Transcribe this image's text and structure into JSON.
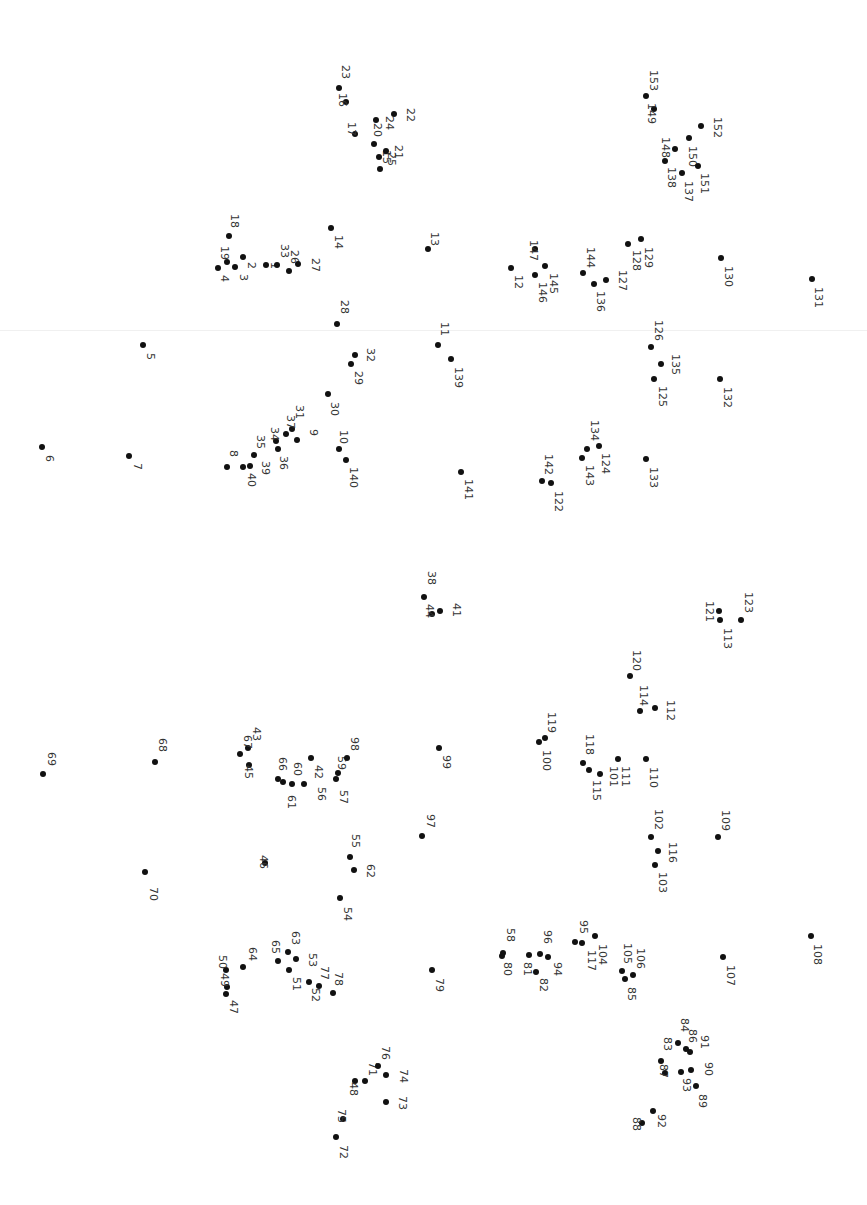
{
  "puzzle": {
    "type": "connect-the-dots",
    "orientation": "rotated-90deg",
    "dot_color": "#111111",
    "label_color": "#333333",
    "background": "#ffffff",
    "total_dots": 153,
    "dots": [
      {
        "n": "1",
        "x": 266,
        "y": 265,
        "lx": 274,
        "ly": 262
      },
      {
        "n": "2",
        "x": 243,
        "y": 257,
        "lx": 251,
        "ly": 262
      },
      {
        "n": "3",
        "x": 235,
        "y": 267,
        "lx": 243,
        "ly": 274
      },
      {
        "n": "4",
        "x": 218,
        "y": 268,
        "lx": 224,
        "ly": 275
      },
      {
        "n": "5",
        "x": 143,
        "y": 345,
        "lx": 150,
        "ly": 353
      },
      {
        "n": "6",
        "x": 42,
        "y": 447,
        "lx": 49,
        "ly": 455
      },
      {
        "n": "7",
        "x": 129,
        "y": 456,
        "lx": 137,
        "ly": 463
      },
      {
        "n": "8",
        "x": 227,
        "y": 467,
        "lx": 233,
        "ly": 450
      },
      {
        "n": "9",
        "x": 297,
        "y": 440,
        "lx": 313,
        "ly": 429
      },
      {
        "n": "10",
        "x": 339,
        "y": 449,
        "lx": 343,
        "ly": 430
      },
      {
        "n": "11",
        "x": 438,
        "y": 345,
        "lx": 444,
        "ly": 322
      },
      {
        "n": "12",
        "x": 511,
        "y": 268,
        "lx": 518,
        "ly": 275
      },
      {
        "n": "13",
        "x": 428,
        "y": 249,
        "lx": 434,
        "ly": 232
      },
      {
        "n": "14",
        "x": 331,
        "y": 228,
        "lx": 338,
        "ly": 235
      },
      {
        "n": "15",
        "x": 380,
        "y": 169,
        "lx": 386,
        "ly": 150
      },
      {
        "n": "16",
        "x": 346,
        "y": 102,
        "lx": 342,
        "ly": 93
      },
      {
        "n": "17",
        "x": 355,
        "y": 134,
        "lx": 351,
        "ly": 122
      },
      {
        "n": "18",
        "x": 229,
        "y": 236,
        "lx": 234,
        "ly": 214
      },
      {
        "n": "19",
        "x": 227,
        "y": 262,
        "lx": 224,
        "ly": 246
      },
      {
        "n": "20",
        "x": 374,
        "y": 144,
        "lx": 377,
        "ly": 123
      },
      {
        "n": "21",
        "x": 386,
        "y": 151,
        "lx": 398,
        "ly": 145
      },
      {
        "n": "22",
        "x": 394,
        "y": 114,
        "lx": 410,
        "ly": 108
      },
      {
        "n": "23",
        "x": 339,
        "y": 88,
        "lx": 345,
        "ly": 65
      },
      {
        "n": "24",
        "x": 376,
        "y": 120,
        "lx": 389,
        "ly": 116
      },
      {
        "n": "25",
        "x": 379,
        "y": 157,
        "lx": 391,
        "ly": 152
      },
      {
        "n": "26",
        "x": 289,
        "y": 271,
        "lx": 294,
        "ly": 250
      },
      {
        "n": "27",
        "x": 298,
        "y": 264,
        "lx": 315,
        "ly": 258
      },
      {
        "n": "28",
        "x": 337,
        "y": 324,
        "lx": 344,
        "ly": 300
      },
      {
        "n": "29",
        "x": 351,
        "y": 364,
        "lx": 358,
        "ly": 371
      },
      {
        "n": "30",
        "x": 328,
        "y": 394,
        "lx": 334,
        "ly": 402
      },
      {
        "n": "31",
        "x": 292,
        "y": 429,
        "lx": 299,
        "ly": 405
      },
      {
        "n": "32",
        "x": 355,
        "y": 355,
        "lx": 370,
        "ly": 348
      },
      {
        "n": "33",
        "x": 277,
        "y": 265,
        "lx": 284,
        "ly": 244
      },
      {
        "n": "34",
        "x": 276,
        "y": 441,
        "lx": 274,
        "ly": 427
      },
      {
        "n": "35",
        "x": 254,
        "y": 455,
        "lx": 260,
        "ly": 435
      },
      {
        "n": "36",
        "x": 278,
        "y": 449,
        "lx": 283,
        "ly": 456
      },
      {
        "n": "37",
        "x": 286,
        "y": 434,
        "lx": 290,
        "ly": 415
      },
      {
        "n": "38",
        "x": 424,
        "y": 597,
        "lx": 431,
        "ly": 571
      },
      {
        "n": "39",
        "x": 250,
        "y": 466,
        "lx": 265,
        "ly": 461
      },
      {
        "n": "40",
        "x": 243,
        "y": 467,
        "lx": 251,
        "ly": 473
      },
      {
        "n": "41",
        "x": 440,
        "y": 611,
        "lx": 456,
        "ly": 603
      },
      {
        "n": "42",
        "x": 311,
        "y": 758,
        "lx": 318,
        "ly": 765
      },
      {
        "n": "43",
        "x": 248,
        "y": 748,
        "lx": 256,
        "ly": 727
      },
      {
        "n": "44",
        "x": 432,
        "y": 614,
        "lx": 429,
        "ly": 604
      },
      {
        "n": "45",
        "x": 249,
        "y": 765,
        "lx": 248,
        "ly": 765
      },
      {
        "n": "46",
        "x": 265,
        "y": 863,
        "lx": 263,
        "ly": 855
      },
      {
        "n": "47",
        "x": 226,
        "y": 994,
        "lx": 233,
        "ly": 1000
      },
      {
        "n": "48",
        "x": 355,
        "y": 1081,
        "lx": 353,
        "ly": 1082
      },
      {
        "n": "49",
        "x": 227,
        "y": 987,
        "lx": 224,
        "ly": 973
      },
      {
        "n": "50",
        "x": 226,
        "y": 970,
        "lx": 222,
        "ly": 955
      },
      {
        "n": "51",
        "x": 289,
        "y": 970,
        "lx": 296,
        "ly": 977
      },
      {
        "n": "52",
        "x": 309,
        "y": 982,
        "lx": 315,
        "ly": 988
      },
      {
        "n": "53",
        "x": 296,
        "y": 959,
        "lx": 312,
        "ly": 953
      },
      {
        "n": "54",
        "x": 340,
        "y": 898,
        "lx": 347,
        "ly": 907
      },
      {
        "n": "55",
        "x": 350,
        "y": 857,
        "lx": 355,
        "ly": 834
      },
      {
        "n": "56",
        "x": 304,
        "y": 784,
        "lx": 321,
        "ly": 787
      },
      {
        "n": "57",
        "x": 336,
        "y": 779,
        "lx": 343,
        "ly": 790
      },
      {
        "n": "58",
        "x": 503,
        "y": 953,
        "lx": 510,
        "ly": 928
      },
      {
        "n": "59",
        "x": 338,
        "y": 773,
        "lx": 341,
        "ly": 756
      },
      {
        "n": "60",
        "x": 292,
        "y": 784,
        "lx": 297,
        "ly": 762
      },
      {
        "n": "61",
        "x": 283,
        "y": 782,
        "lx": 291,
        "ly": 795
      },
      {
        "n": "62",
        "x": 354,
        "y": 870,
        "lx": 370,
        "ly": 864
      },
      {
        "n": "63",
        "x": 288,
        "y": 952,
        "lx": 295,
        "ly": 931
      },
      {
        "n": "64",
        "x": 243,
        "y": 967,
        "lx": 252,
        "ly": 947
      },
      {
        "n": "65",
        "x": 278,
        "y": 961,
        "lx": 275,
        "ly": 940
      },
      {
        "n": "66",
        "x": 278,
        "y": 779,
        "lx": 282,
        "ly": 757
      },
      {
        "n": "67",
        "x": 240,
        "y": 754,
        "lx": 247,
        "ly": 735
      },
      {
        "n": "68",
        "x": 155,
        "y": 762,
        "lx": 162,
        "ly": 738
      },
      {
        "n": "69",
        "x": 43,
        "y": 774,
        "lx": 51,
        "ly": 752
      },
      {
        "n": "70",
        "x": 145,
        "y": 872,
        "lx": 153,
        "ly": 887
      },
      {
        "n": "71",
        "x": 365,
        "y": 1081,
        "lx": 372,
        "ly": 1062
      },
      {
        "n": "72",
        "x": 336,
        "y": 1137,
        "lx": 343,
        "ly": 1145
      },
      {
        "n": "73",
        "x": 386,
        "y": 1102,
        "lx": 402,
        "ly": 1096
      },
      {
        "n": "74",
        "x": 386,
        "y": 1075,
        "lx": 403,
        "ly": 1069
      },
      {
        "n": "75",
        "x": 343,
        "y": 1119,
        "lx": 341,
        "ly": 1109
      },
      {
        "n": "76",
        "x": 378,
        "y": 1066,
        "lx": 385,
        "ly": 1046
      },
      {
        "n": "77",
        "x": 319,
        "y": 986,
        "lx": 324,
        "ly": 966
      },
      {
        "n": "78",
        "x": 333,
        "y": 993,
        "lx": 338,
        "ly": 972
      },
      {
        "n": "79",
        "x": 432,
        "y": 970,
        "lx": 439,
        "ly": 978
      },
      {
        "n": "80",
        "x": 502,
        "y": 956,
        "lx": 507,
        "ly": 962
      },
      {
        "n": "81",
        "x": 529,
        "y": 955,
        "lx": 527,
        "ly": 962
      },
      {
        "n": "82",
        "x": 536,
        "y": 972,
        "lx": 543,
        "ly": 978
      },
      {
        "n": "83",
        "x": 661,
        "y": 1061,
        "lx": 667,
        "ly": 1037
      },
      {
        "n": "84",
        "x": 678,
        "y": 1043,
        "lx": 684,
        "ly": 1018
      },
      {
        "n": "85",
        "x": 625,
        "y": 979,
        "lx": 631,
        "ly": 987
      },
      {
        "n": "86",
        "x": 686,
        "y": 1049,
        "lx": 692,
        "ly": 1029
      },
      {
        "n": "87",
        "x": 665,
        "y": 1073,
        "lx": 663,
        "ly": 1064
      },
      {
        "n": "88",
        "x": 642,
        "y": 1123,
        "lx": 636,
        "ly": 1117
      },
      {
        "n": "89",
        "x": 696,
        "y": 1086,
        "lx": 702,
        "ly": 1094
      },
      {
        "n": "90",
        "x": 691,
        "y": 1070,
        "lx": 708,
        "ly": 1062
      },
      {
        "n": "91",
        "x": 690,
        "y": 1052,
        "lx": 704,
        "ly": 1035
      },
      {
        "n": "92",
        "x": 653,
        "y": 1111,
        "lx": 661,
        "ly": 1114
      },
      {
        "n": "93",
        "x": 681,
        "y": 1072,
        "lx": 686,
        "ly": 1078
      },
      {
        "n": "94",
        "x": 548,
        "y": 957,
        "lx": 557,
        "ly": 962
      },
      {
        "n": "95",
        "x": 575,
        "y": 942,
        "lx": 583,
        "ly": 920
      },
      {
        "n": "96",
        "x": 540,
        "y": 954,
        "lx": 547,
        "ly": 930
      },
      {
        "n": "97",
        "x": 422,
        "y": 836,
        "lx": 430,
        "ly": 814
      },
      {
        "n": "98",
        "x": 347,
        "y": 758,
        "lx": 354,
        "ly": 737
      },
      {
        "n": "99",
        "x": 439,
        "y": 748,
        "lx": 446,
        "ly": 755
      },
      {
        "n": "100",
        "x": 539,
        "y": 742,
        "lx": 546,
        "ly": 750
      },
      {
        "n": "101",
        "x": 600,
        "y": 774,
        "lx": 613,
        "ly": 766
      },
      {
        "n": "102",
        "x": 651,
        "y": 837,
        "lx": 658,
        "ly": 809
      },
      {
        "n": "103",
        "x": 655,
        "y": 865,
        "lx": 662,
        "ly": 872
      },
      {
        "n": "104",
        "x": 595,
        "y": 936,
        "lx": 602,
        "ly": 944
      },
      {
        "n": "105",
        "x": 622,
        "y": 971,
        "lx": 627,
        "ly": 943
      },
      {
        "n": "106",
        "x": 633,
        "y": 975,
        "lx": 640,
        "ly": 948
      },
      {
        "n": "107",
        "x": 723,
        "y": 957,
        "lx": 730,
        "ly": 965
      },
      {
        "n": "108",
        "x": 811,
        "y": 936,
        "lx": 817,
        "ly": 944
      },
      {
        "n": "109",
        "x": 718,
        "y": 837,
        "lx": 725,
        "ly": 810
      },
      {
        "n": "110",
        "x": 646,
        "y": 759,
        "lx": 653,
        "ly": 767
      },
      {
        "n": "111",
        "x": 618,
        "y": 759,
        "lx": 625,
        "ly": 766
      },
      {
        "n": "112",
        "x": 655,
        "y": 708,
        "lx": 670,
        "ly": 700
      },
      {
        "n": "113",
        "x": 720,
        "y": 620,
        "lx": 727,
        "ly": 628
      },
      {
        "n": "114",
        "x": 640,
        "y": 711,
        "lx": 643,
        "ly": 685
      },
      {
        "n": "115",
        "x": 589,
        "y": 770,
        "lx": 596,
        "ly": 780
      },
      {
        "n": "116",
        "x": 658,
        "y": 851,
        "lx": 672,
        "ly": 842
      },
      {
        "n": "117",
        "x": 582,
        "y": 943,
        "lx": 591,
        "ly": 950
      },
      {
        "n": "118",
        "x": 583,
        "y": 763,
        "lx": 589,
        "ly": 734
      },
      {
        "n": "119",
        "x": 545,
        "y": 738,
        "lx": 551,
        "ly": 712
      },
      {
        "n": "120",
        "x": 630,
        "y": 676,
        "lx": 636,
        "ly": 650
      },
      {
        "n": "121",
        "x": 719,
        "y": 611,
        "lx": 709,
        "ly": 601
      },
      {
        "n": "122",
        "x": 551,
        "y": 483,
        "lx": 558,
        "ly": 491
      },
      {
        "n": "123",
        "x": 741,
        "y": 620,
        "lx": 748,
        "ly": 592
      },
      {
        "n": "124",
        "x": 599,
        "y": 446,
        "lx": 605,
        "ly": 453
      },
      {
        "n": "125",
        "x": 654,
        "y": 379,
        "lx": 662,
        "ly": 386
      },
      {
        "n": "126",
        "x": 651,
        "y": 347,
        "lx": 658,
        "ly": 320
      },
      {
        "n": "127",
        "x": 606,
        "y": 280,
        "lx": 622,
        "ly": 270
      },
      {
        "n": "128",
        "x": 628,
        "y": 244,
        "lx": 636,
        "ly": 250
      },
      {
        "n": "129",
        "x": 641,
        "y": 239,
        "lx": 648,
        "ly": 247
      },
      {
        "n": "130",
        "x": 721,
        "y": 258,
        "lx": 728,
        "ly": 266
      },
      {
        "n": "131",
        "x": 812,
        "y": 279,
        "lx": 818,
        "ly": 287
      },
      {
        "n": "132",
        "x": 720,
        "y": 379,
        "lx": 727,
        "ly": 387
      },
      {
        "n": "133",
        "x": 646,
        "y": 459,
        "lx": 653,
        "ly": 467
      },
      {
        "n": "134",
        "x": 587,
        "y": 449,
        "lx": 594,
        "ly": 420
      },
      {
        "n": "135",
        "x": 661,
        "y": 364,
        "lx": 675,
        "ly": 354
      },
      {
        "n": "136",
        "x": 594,
        "y": 284,
        "lx": 600,
        "ly": 291
      },
      {
        "n": "137",
        "x": 682,
        "y": 173,
        "lx": 688,
        "ly": 181
      },
      {
        "n": "138",
        "x": 665,
        "y": 161,
        "lx": 671,
        "ly": 167
      },
      {
        "n": "139",
        "x": 451,
        "y": 359,
        "lx": 458,
        "ly": 367
      },
      {
        "n": "140",
        "x": 346,
        "y": 460,
        "lx": 353,
        "ly": 467
      },
      {
        "n": "141",
        "x": 461,
        "y": 472,
        "lx": 468,
        "ly": 479
      },
      {
        "n": "142",
        "x": 542,
        "y": 481,
        "lx": 548,
        "ly": 454
      },
      {
        "n": "143",
        "x": 582,
        "y": 458,
        "lx": 589,
        "ly": 465
      },
      {
        "n": "144",
        "x": 583,
        "y": 273,
        "lx": 590,
        "ly": 247
      },
      {
        "n": "145",
        "x": 545,
        "y": 266,
        "lx": 553,
        "ly": 273
      },
      {
        "n": "146",
        "x": 535,
        "y": 275,
        "lx": 542,
        "ly": 282
      },
      {
        "n": "147",
        "x": 535,
        "y": 249,
        "lx": 533,
        "ly": 240
      },
      {
        "n": "148",
        "x": 675,
        "y": 149,
        "lx": 665,
        "ly": 137
      },
      {
        "n": "149",
        "x": 654,
        "y": 109,
        "lx": 651,
        "ly": 103
      },
      {
        "n": "150",
        "x": 689,
        "y": 138,
        "lx": 692,
        "ly": 146
      },
      {
        "n": "151",
        "x": 698,
        "y": 166,
        "lx": 704,
        "ly": 173
      },
      {
        "n": "152",
        "x": 701,
        "y": 126,
        "lx": 717,
        "ly": 117
      },
      {
        "n": "153",
        "x": 646,
        "y": 96,
        "lx": 653,
        "ly": 70
      }
    ]
  }
}
